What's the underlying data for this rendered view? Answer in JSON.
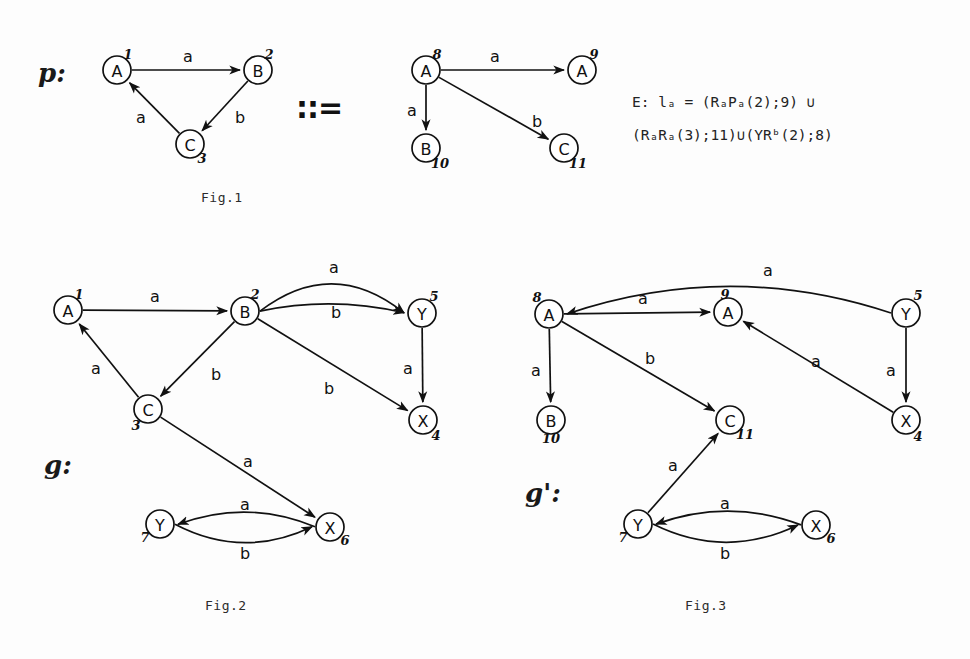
{
  "figure": {
    "title_symbol": "::=",
    "captions": [
      {
        "id": "fig1",
        "text": "Fig.1",
        "x": 201,
        "y": 196
      },
      {
        "id": "fig2",
        "text": "Fig.2",
        "x": 205,
        "y": 604
      },
      {
        "id": "fig3",
        "text": "Fig.3",
        "x": 685,
        "y": 604
      }
    ],
    "graph_labels": [
      {
        "id": "p",
        "text": "p:",
        "x": 38,
        "y": 74
      },
      {
        "id": "g",
        "text": "g:",
        "x": 44,
        "y": 466
      },
      {
        "id": "gprime",
        "text": "g':",
        "x": 525,
        "y": 494
      }
    ],
    "formula": {
      "line1_prefix": "E:",
      "line1_body": "l",
      "line1_sub": "a",
      "line1_rest": " = (R",
      "full_line1": "E:  lₐ  =  (RₐPₐ(2);9) ∪",
      "full_line2": "(RₐRₐ(3);11)∪(YRᵇ(2);8)",
      "tokens_line1": [
        "E:",
        "l",
        "a",
        "=",
        "(R",
        "a",
        "P",
        "a",
        "(2);9)",
        "∪"
      ],
      "tokens_line2": [
        "(R",
        "a",
        "R",
        "a",
        "(3);11)",
        "∪",
        "(YR",
        "b",
        "(2);8)"
      ],
      "x": 632,
      "y1": 101,
      "y2": 134
    }
  },
  "fig1": {
    "name": "Fig.1",
    "left_graph": {
      "name": "p-left",
      "nodes": [
        {
          "id": "n1",
          "label": "A",
          "number": "1",
          "cx": 117,
          "cy": 70,
          "r": 14,
          "num_dx": 11,
          "num_dy": -16
        },
        {
          "id": "n2",
          "label": "B",
          "number": "2",
          "cx": 258,
          "cy": 70,
          "r": 14,
          "num_dx": 11,
          "num_dy": -16
        },
        {
          "id": "n3",
          "label": "C",
          "number": "3",
          "cx": 190,
          "cy": 144,
          "r": 14,
          "num_dx": 12,
          "num_dy": 14
        }
      ],
      "edges": [
        {
          "id": "e1",
          "from": "n1",
          "to": "n2",
          "label": "a",
          "lx": 188,
          "ly": 56
        },
        {
          "id": "e2",
          "from": "n2",
          "to": "n3",
          "label": "b",
          "lx": 240,
          "ly": 117
        },
        {
          "id": "e3",
          "from": "n3",
          "to": "n1",
          "label": "a",
          "lx": 141,
          "ly": 117
        }
      ]
    },
    "right_graph": {
      "name": "p-right",
      "nodes": [
        {
          "id": "n8",
          "label": "A",
          "number": "8",
          "cx": 426,
          "cy": 70,
          "r": 14,
          "num_dx": 11,
          "num_dy": -16
        },
        {
          "id": "n9",
          "label": "A",
          "number": "9",
          "cx": 582,
          "cy": 70,
          "r": 14,
          "num_dx": 12,
          "num_dy": -16
        },
        {
          "id": "n10",
          "label": "B",
          "number": "10",
          "cx": 426,
          "cy": 148,
          "r": 14,
          "num_dx": 14,
          "num_dy": 15
        },
        {
          "id": "n11",
          "label": "C",
          "number": "11",
          "cx": 564,
          "cy": 148,
          "r": 14,
          "num_dx": 14,
          "num_dy": 15
        }
      ],
      "edges": [
        {
          "id": "e4",
          "from": "n8",
          "to": "n9",
          "label": "a",
          "lx": 495,
          "ly": 56
        },
        {
          "id": "e5",
          "from": "n8",
          "to": "n10",
          "label": "a",
          "lx": 412,
          "ly": 110
        },
        {
          "id": "e6",
          "from": "n8",
          "to": "n11",
          "label": "b",
          "lx": 537,
          "ly": 121
        }
      ]
    }
  },
  "fig2": {
    "name": "Fig.2",
    "nodes": [
      {
        "id": "g1",
        "label": "A",
        "number": "1",
        "cx": 68,
        "cy": 310,
        "r": 14,
        "num_dx": 11,
        "num_dy": -16
      },
      {
        "id": "g2",
        "label": "B",
        "number": "2",
        "cx": 245,
        "cy": 311,
        "r": 14,
        "num_dx": 10,
        "num_dy": -17
      },
      {
        "id": "g3",
        "label": "C",
        "number": "3",
        "cx": 148,
        "cy": 409,
        "r": 14,
        "num_dx": -12,
        "num_dy": 16
      },
      {
        "id": "g5",
        "label": "Y",
        "number": "5",
        "cx": 422,
        "cy": 313,
        "r": 14,
        "num_dx": 12,
        "num_dy": -17
      },
      {
        "id": "g4",
        "label": "X",
        "number": "4",
        "cx": 423,
        "cy": 420,
        "r": 14,
        "num_dx": 13,
        "num_dy": 15
      },
      {
        "id": "g7",
        "label": "Y",
        "number": "7",
        "cx": 160,
        "cy": 524,
        "r": 14,
        "num_dx": -15,
        "num_dy": 13
      },
      {
        "id": "g6",
        "label": "X",
        "number": "6",
        "cx": 330,
        "cy": 527,
        "r": 14,
        "num_dx": 15,
        "num_dy": 13
      }
    ],
    "edges": [
      {
        "id": "ge1",
        "from": "g1",
        "to": "g2",
        "label": "a",
        "lx": 155,
        "ly": 296
      },
      {
        "id": "ge2",
        "from": "g2",
        "to": "g5",
        "label": "a",
        "lx": 334,
        "ly": 267,
        "curved": true
      },
      {
        "id": "ge3",
        "from": "g2",
        "to": "g5",
        "label": "b",
        "lx": 336,
        "ly": 312,
        "curved": true
      },
      {
        "id": "ge4",
        "from": "g2",
        "to": "g3",
        "label": "b",
        "lx": 216,
        "ly": 374
      },
      {
        "id": "ge5",
        "from": "g2",
        "to": "g4",
        "label": "b",
        "lx": 329,
        "ly": 388
      },
      {
        "id": "ge6",
        "from": "g5",
        "to": "g4",
        "label": "a",
        "lx": 408,
        "ly": 368
      },
      {
        "id": "ge7",
        "from": "g3",
        "to": "g1",
        "label": "a",
        "lx": 96,
        "ly": 368
      },
      {
        "id": "ge8",
        "from": "g3",
        "to": "g6",
        "label": "a",
        "lx": 248,
        "ly": 461
      },
      {
        "id": "ge9",
        "from": "g6",
        "to": "g7",
        "label": "a",
        "lx": 245,
        "ly": 504,
        "curved": true
      },
      {
        "id": "ge10",
        "from": "g7",
        "to": "g6",
        "label": "b",
        "lx": 245,
        "ly": 553,
        "curved": true
      }
    ]
  },
  "fig3": {
    "name": "Fig.3",
    "nodes": [
      {
        "id": "h8",
        "label": "A",
        "number": "8",
        "cx": 549,
        "cy": 314,
        "r": 14,
        "num_dx": -12,
        "num_dy": -17
      },
      {
        "id": "h9",
        "label": "A",
        "number": "9",
        "cx": 728,
        "cy": 312,
        "r": 14,
        "num_dx": -3,
        "num_dy": -18
      },
      {
        "id": "h10",
        "label": "B",
        "number": "10",
        "cx": 551,
        "cy": 420,
        "r": 14,
        "num_dx": 0,
        "num_dy": 18
      },
      {
        "id": "h11",
        "label": "C",
        "number": "11",
        "cx": 730,
        "cy": 420,
        "r": 14,
        "num_dx": 15,
        "num_dy": 14
      },
      {
        "id": "h5",
        "label": "Y",
        "number": "5",
        "cx": 906,
        "cy": 313,
        "r": 14,
        "num_dx": 12,
        "num_dy": -18
      },
      {
        "id": "h4",
        "label": "X",
        "number": "4",
        "cx": 906,
        "cy": 420,
        "r": 14,
        "num_dx": 12,
        "num_dy": 16
      },
      {
        "id": "h7",
        "label": "Y",
        "number": "7",
        "cx": 638,
        "cy": 524,
        "r": 14,
        "num_dx": -15,
        "num_dy": 13
      },
      {
        "id": "h6",
        "label": "X",
        "number": "6",
        "cx": 816,
        "cy": 525,
        "r": 14,
        "num_dx": 15,
        "num_dy": 13
      }
    ],
    "edges": [
      {
        "id": "he1",
        "from": "h8",
        "to": "h9",
        "label": "a",
        "lx": 643,
        "ly": 298
      },
      {
        "id": "he2",
        "from": "h8",
        "to": "h10",
        "label": "a",
        "lx": 536,
        "ly": 370
      },
      {
        "id": "he3",
        "from": "h8",
        "to": "h11",
        "label": "b",
        "lx": 650,
        "ly": 358
      },
      {
        "id": "he4",
        "from": "h5",
        "to": "h8",
        "label": "a",
        "lx": 768,
        "ly": 270,
        "curved": true
      },
      {
        "id": "he5",
        "from": "h5",
        "to": "h4",
        "label": "a",
        "lx": 891,
        "ly": 370
      },
      {
        "id": "he6",
        "from": "h4",
        "to": "h9",
        "label": "a",
        "lx": 816,
        "ly": 361
      },
      {
        "id": "he7",
        "from": "h7",
        "to": "h11",
        "label": "a",
        "lx": 673,
        "ly": 465
      },
      {
        "id": "he8",
        "from": "h6",
        "to": "h7",
        "label": "a",
        "lx": 725,
        "ly": 503,
        "curved": true
      },
      {
        "id": "he9",
        "from": "h7",
        "to": "h6",
        "label": "b",
        "lx": 725,
        "ly": 553,
        "curved": true
      }
    ]
  }
}
